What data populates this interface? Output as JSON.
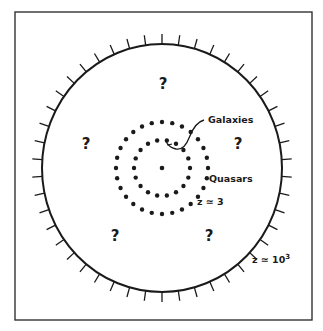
{
  "diagram": {
    "colors": {
      "ink": "#1a1a1a",
      "background": "#ffffff",
      "frame": "#333333"
    },
    "frame": {
      "x": 15,
      "y": 12,
      "width": 297,
      "height": 308
    },
    "horizon_circle": {
      "cx": 162,
      "cy": 168,
      "rx": 120,
      "ry": 124,
      "tick_count": 46,
      "tick_length": 10
    },
    "center_dot": {
      "cx": 162,
      "cy": 168,
      "r": 2.3
    },
    "rings": [
      {
        "name": "galaxies-ring",
        "radius": 28,
        "dot_count": 18,
        "dot_r": 2.2
      },
      {
        "name": "quasars-ring",
        "radius": 46,
        "dot_count": 28,
        "dot_r": 2.2
      }
    ],
    "labels": {
      "galaxies": "Galaxies",
      "quasars": "Quasars",
      "z_quasars": "z ≃ 3",
      "z_horizon_prefix": "z ≃ 10",
      "z_horizon_exp": "3",
      "unknown": "?"
    },
    "unknown_marks": [
      {
        "x": 163,
        "y": 89
      },
      {
        "x": 86,
        "y": 149
      },
      {
        "x": 238,
        "y": 149
      },
      {
        "x": 115,
        "y": 241
      },
      {
        "x": 209,
        "y": 241
      }
    ]
  }
}
